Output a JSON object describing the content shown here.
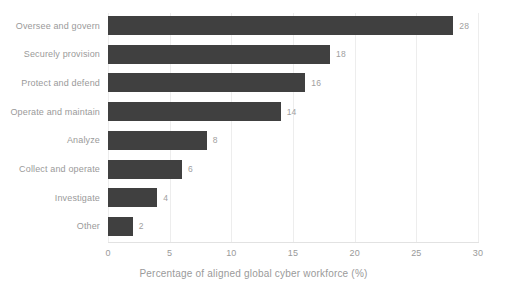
{
  "chart_data": {
    "type": "bar",
    "orientation": "horizontal",
    "title": "",
    "xlabel": "Percentage of aligned global cyber workforce (%)",
    "ylabel": "",
    "xlim": [
      0,
      30
    ],
    "xticks": [
      "0",
      "5",
      "10",
      "15",
      "20",
      "25",
      "30"
    ],
    "grid": true,
    "legend": false,
    "categories": [
      "Oversee and govern",
      "Securely provision",
      "Protect and defend",
      "Operate and maintain",
      "Analyze",
      "Collect and operate",
      "Investigate",
      "Other"
    ],
    "values": [
      28,
      18,
      16,
      14,
      8,
      6,
      4,
      2
    ],
    "value_labels": [
      "28",
      "18",
      "16",
      "14",
      "8",
      "6",
      "4",
      "2"
    ],
    "colors": {
      "bar": "#404040",
      "text": "#9a9a9a",
      "grid": "#ededed",
      "axis": "#e2e2e2",
      "background": "#ffffff"
    }
  }
}
